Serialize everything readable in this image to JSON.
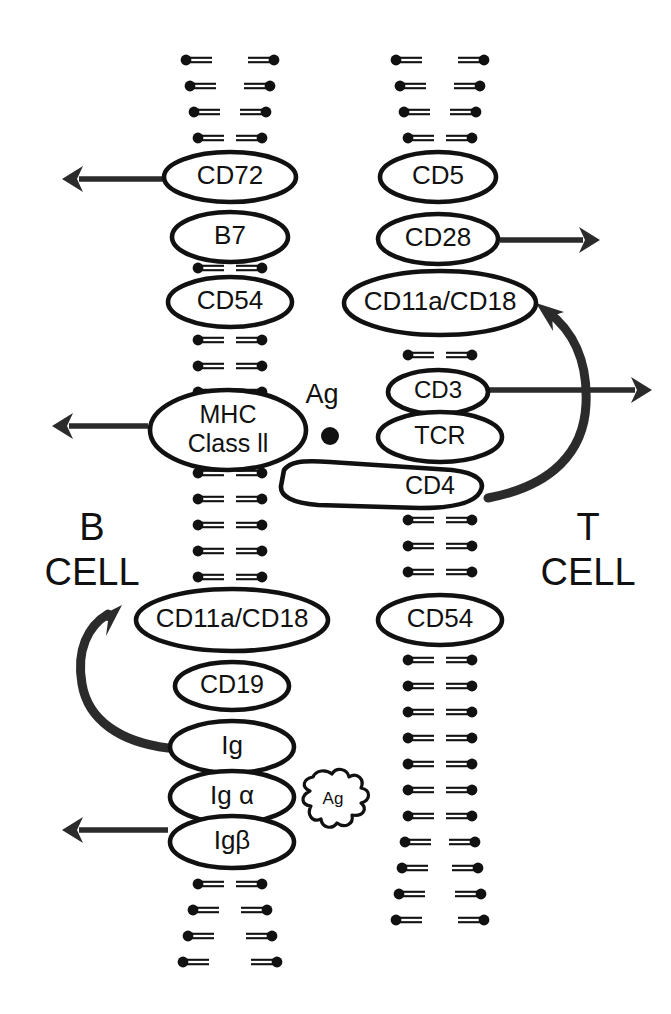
{
  "figure": {
    "background_color": "#ffffff",
    "ink_color": "#111111",
    "arrow_color": "#2b2b2b",
    "width": 671,
    "height": 1014
  },
  "cells": {
    "left": {
      "name": "B CELL",
      "line1": "B",
      "line2": "CELL",
      "x": 92,
      "y1": 540,
      "y2": 585
    },
    "right": {
      "name": "T CELL",
      "line1": "T",
      "line2": "CELL",
      "x": 588,
      "y1": 540,
      "y2": 585
    }
  },
  "b_cell_receptors": [
    {
      "label": "CD72",
      "cx": 230,
      "cy": 177,
      "rx": 66,
      "ry": 25,
      "font": 26,
      "shape": "ellipse"
    },
    {
      "label": "B7",
      "cx": 230,
      "cy": 237,
      "rx": 58,
      "ry": 25,
      "font": 26,
      "shape": "ellipse"
    },
    {
      "label": "CD54",
      "cx": 230,
      "cy": 302,
      "rx": 62,
      "ry": 25,
      "font": 26,
      "shape": "ellipse"
    },
    {
      "label": "MHC Class II",
      "cx": 228,
      "cy": 430,
      "rx": 78,
      "ry": 40,
      "font": 25,
      "shape": "ellipse",
      "line1": "MHC",
      "line2": "Class ll"
    },
    {
      "label": "CD11a/CD18",
      "cx": 232,
      "cy": 620,
      "rx": 96,
      "ry": 31,
      "font": 26,
      "shape": "ellipse"
    },
    {
      "label": "CD19",
      "cx": 232,
      "cy": 686,
      "rx": 57,
      "ry": 24,
      "font": 25,
      "shape": "ellipse"
    },
    {
      "label": "Ig",
      "cx": 232,
      "cy": 747,
      "rx": 62,
      "ry": 26,
      "font": 26,
      "shape": "ellipse"
    },
    {
      "label": "Ig α",
      "cx": 232,
      "cy": 797,
      "rx": 62,
      "ry": 26,
      "font": 26,
      "shape": "ellipse"
    },
    {
      "label": "Igβ",
      "cx": 232,
      "cy": 842,
      "rx": 62,
      "ry": 26,
      "font": 26,
      "shape": "ellipse"
    }
  ],
  "t_cell_receptors": [
    {
      "label": "CD5",
      "cx": 438,
      "cy": 177,
      "rx": 58,
      "ry": 25,
      "font": 26,
      "shape": "ellipse"
    },
    {
      "label": "CD28",
      "cx": 438,
      "cy": 239,
      "rx": 60,
      "ry": 25,
      "font": 26,
      "shape": "ellipse"
    },
    {
      "label": "CD11a/CD18",
      "cx": 440,
      "cy": 303,
      "rx": 96,
      "ry": 32,
      "font": 26,
      "shape": "ellipse"
    },
    {
      "label": "CD3",
      "cx": 438,
      "cy": 392,
      "rx": 50,
      "ry": 22,
      "font": 24,
      "shape": "ellipse"
    },
    {
      "label": "TCR",
      "cx": 440,
      "cy": 437,
      "rx": 62,
      "ry": 25,
      "font": 25,
      "shape": "ellipse"
    },
    {
      "label": "CD4",
      "cx": 430,
      "cy": 490,
      "font": 25,
      "shape": "cd4-bar"
    },
    {
      "label": "CD54",
      "cx": 440,
      "cy": 620,
      "rx": 62,
      "ry": 25,
      "font": 26,
      "shape": "ellipse"
    }
  ],
  "antigens": [
    {
      "name": "antigen-dot-label",
      "label": "Ag",
      "x": 322,
      "y": 403,
      "type": "text"
    },
    {
      "name": "antigen-dot",
      "label": "",
      "x": 330,
      "y": 436,
      "r": 9,
      "type": "dot"
    },
    {
      "name": "antigen-blob",
      "label": "Ag",
      "x": 333,
      "y": 800,
      "type": "blob"
    }
  ],
  "arrows": [
    {
      "name": "cd72-output-arrow",
      "direction": "left",
      "from": "CD72",
      "x1": 163,
      "y1": 179,
      "x2": 62,
      "y2": 179
    },
    {
      "name": "mhc-output-arrow",
      "direction": "left",
      "from": "MHC Class II",
      "x1": 148,
      "y1": 426,
      "x2": 52,
      "y2": 426
    },
    {
      "name": "igbeta-output-arrow",
      "direction": "left",
      "from": "Igβ",
      "x1": 168,
      "y1": 830,
      "x2": 62,
      "y2": 830
    },
    {
      "name": "cd28-output-arrow",
      "direction": "right",
      "from": "CD28",
      "x1": 500,
      "y1": 240,
      "x2": 600,
      "y2": 240
    },
    {
      "name": "cd3-output-arrow",
      "direction": "right",
      "from": "CD3",
      "x1": 488,
      "y1": 390,
      "x2": 652,
      "y2": 390
    },
    {
      "name": "t-cell-curved-arrow",
      "direction": "curved-up",
      "from": "CD4",
      "to": "CD11a/CD18"
    },
    {
      "name": "b-cell-curved-arrow",
      "direction": "curved-up",
      "from": "Ig",
      "to": "CD11a/CD18"
    }
  ],
  "membranes": {
    "description": "Phospholipid bilayer drawn as paired lipid glyphs; round head with double-line tail",
    "left_center_x": 230,
    "right_center_x": 440,
    "left_segments": [
      {
        "name": "b-membrane-top",
        "rows": [
          60,
          86,
          112,
          138
        ]
      },
      {
        "name": "b-membrane-mid1",
        "rows": [
          268
        ]
      },
      {
        "name": "b-membrane-mid2",
        "rows": [
          340,
          366,
          392
        ]
      },
      {
        "name": "b-membrane-mid3",
        "rows": [
          473,
          499,
          525,
          551,
          577
        ]
      },
      {
        "name": "b-membrane-bottom",
        "rows": [
          884,
          910,
          936,
          962
        ]
      }
    ],
    "right_segments": [
      {
        "name": "t-membrane-top",
        "rows": [
          60,
          86,
          112,
          138
        ]
      },
      {
        "name": "t-membrane-mid1",
        "rows": [
          355
        ]
      },
      {
        "name": "t-membrane-mid2",
        "rows": [
          520,
          546,
          572
        ]
      },
      {
        "name": "t-membrane-bottom",
        "rows": [
          660,
          686,
          712,
          738,
          764,
          790,
          816,
          842,
          868,
          894,
          920
        ]
      }
    ]
  }
}
